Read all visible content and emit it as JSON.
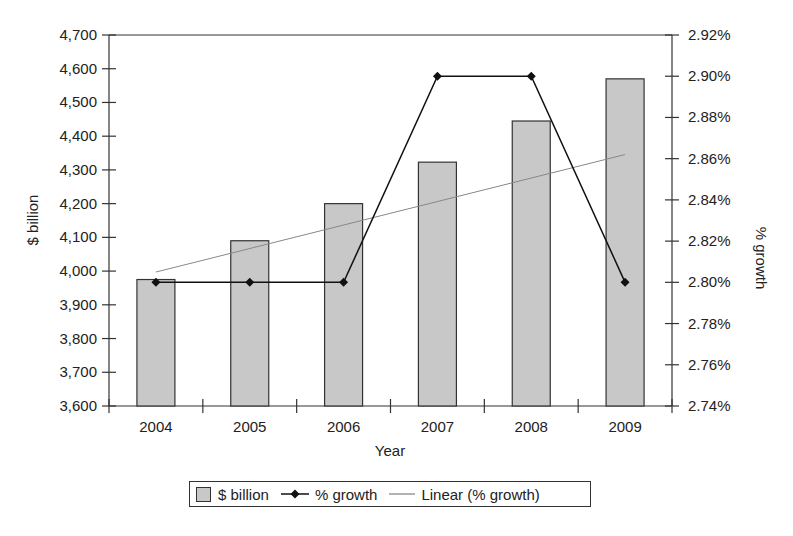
{
  "chart_data": {
    "type": "bar",
    "combo": "bar + line (secondary axis) + linear trendline",
    "categories": [
      "2004",
      "2005",
      "2006",
      "2007",
      "2008",
      "2009"
    ],
    "series": [
      {
        "name": "$ billion",
        "type": "bar",
        "axis": "left",
        "values": [
          3975,
          4090,
          4200,
          4323,
          4445,
          4570
        ],
        "color": "#c8c8c8"
      },
      {
        "name": "% growth",
        "type": "line",
        "axis": "right",
        "marker": "diamond",
        "values": [
          2.8,
          2.8,
          2.8,
          2.9,
          2.9,
          2.8
        ],
        "color": "#111111"
      },
      {
        "name": "Linear (% growth)",
        "type": "trendline",
        "axis": "right",
        "values": [
          2.805,
          2.8164,
          2.8278,
          2.8392,
          2.8506,
          2.862
        ],
        "color": "#888888"
      }
    ],
    "xlabel": "Year",
    "ylabel": "$ billion",
    "y2label": "% growth",
    "ylim": [
      3600,
      4700
    ],
    "y2lim": [
      2.74,
      2.92
    ],
    "yticks": [
      "3,600",
      "3,700",
      "3,800",
      "3,900",
      "4,000",
      "4,100",
      "4,200",
      "4,300",
      "4,400",
      "4,500",
      "4,600",
      "4,700"
    ],
    "y2ticks": [
      "2.74%",
      "2.76%",
      "2.78%",
      "2.80%",
      "2.82%",
      "2.84%",
      "2.86%",
      "2.88%",
      "2.90%",
      "2.92%"
    ],
    "grid": false,
    "legend_position": "bottom"
  },
  "legend": {
    "items": [
      {
        "label": "$ billion"
      },
      {
        "label": "% growth"
      },
      {
        "label": "Linear (% growth)"
      }
    ]
  }
}
